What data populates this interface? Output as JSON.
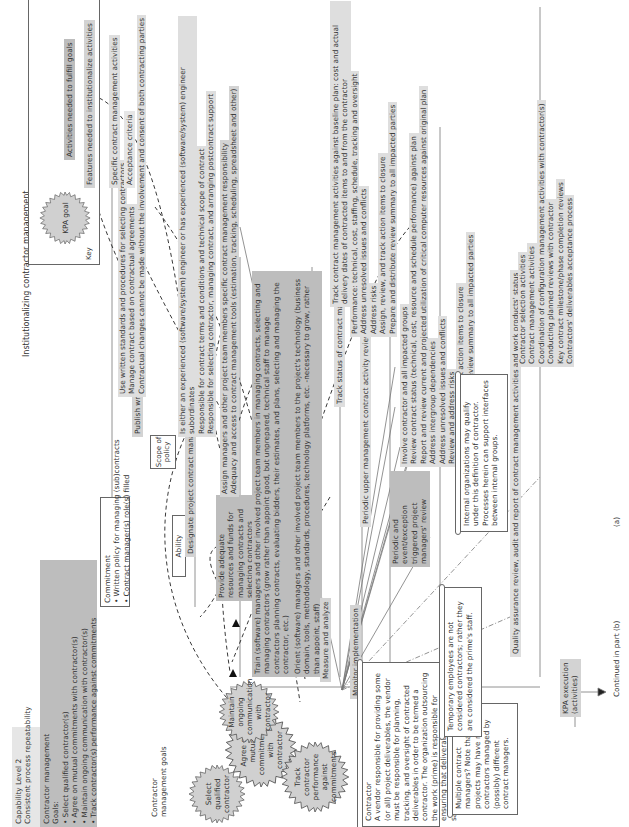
{
  "title": "Institutionalizing contractor management",
  "header": {
    "level": "Capability Level 2",
    "subtitle": "Consistent process repeatability",
    "kpa": "Contractor management",
    "goals_label": "Goals:",
    "goals": [
      "Select qualified contractor(s)",
      "Agree on mutual commitments with contractor(s)",
      "Maintain ongoing communication with contractor(s)",
      "Track contractor(s) performance against commitments"
    ]
  },
  "key": {
    "title": "Key",
    "seal_label": "KPA goal",
    "items": [
      "Activities needed to fulfill goals",
      "Features needed to institutionalize activities",
      "Specific contract management activities",
      "Acceptance criteria"
    ]
  },
  "commitment": {
    "title": "Commitment",
    "items": [
      "Written policy for managing (sub)contracts",
      "Contract manager(s) role(s) filled"
    ]
  },
  "policy": {
    "label": "Publish written contract management policy",
    "scope_note": "Scope of policy",
    "items": [
      "Use written standards and procedures for selecting contractors",
      "Manage contract based on contractual agreements",
      "Contractual changes cannot be made without the involvement and consent of both contracting parties"
    ]
  },
  "ability": {
    "label": "Ability",
    "designate": {
      "label": "Designate project contract manager(s)",
      "items": [
        "Is either an experienced (software/system) engineer or has experienced (software/system) engineer subordinates",
        "Responsible for contract terms and conditions and technical scope of contract",
        "Responsible for selecting contractor, managing contract, and arranging postcontract support"
      ]
    },
    "resources": {
      "label": "Provide adequate resources and funds for managing contracts and selecting contractors",
      "items": [
        "Assign managers and other project team members specific contract management responsibility",
        "Adequacy and access to contract management tools (estimation, tracking, scheduling, spreadsheet and other)"
      ]
    },
    "train": "Train (software) managers and other involved project team members in managing contracts, selecting and managing contractors (grow rather than appoint good, but unprepared, technical staff to manage contractors planning contracts, evaluating bidders, their estimates, and plans, selecting and managing the contractor, etc.)",
    "orient": "Orient (software) managers and other involved project team members to the project's technology (business domain, tools, methodology, standards, procedures, technology platforms, etc. -necessary to grow, rather than appoint, staff)"
  },
  "measure": {
    "label": "Measure and analyze",
    "track_status": "Track status of contract management activities",
    "track_items": [
      "Track contract management activities against baseline plan: cost and actual delivery dates of contracted items to and from the contractor"
    ]
  },
  "monitor": {
    "label": "Monitor implementation",
    "periodic_upper": "Periodic upper management contract activity review",
    "periodic_upper_items": [
      "Performance: technical, cost, staffing, schedule, tracking and oversight",
      "Address unresolved issues and conflicts",
      "Address risks",
      "Assign, review, and track action items to closure",
      "Prepare and distribute review summary to all impacted parties"
    ],
    "periodic_pm": "Periodic and event/exception triggered project managers' review",
    "periodic_pm_items": [
      "Involve contractor and all impacted groups",
      "Review contract status (technical, cost, resource and schedule performance) against plan",
      "Report and review current and projected utilization of critical computer resources against original plan",
      "Address intergroup dependencies",
      "Address unresolved issues and conflicts",
      "Review and address risks",
      "Assign, review, and track action items to closure",
      "Prepare and distribute review summary to all impacted parties"
    ],
    "qa": "Quality assurance review, audit and report of contract management activities and work products' status",
    "qa_items": [
      "Contractor selection activities",
      "Contract management activities",
      "Coordination of configuration management activities with contractor(s)",
      "Conducting planned reviews with contractor",
      "Key contract milestone/phase completion reviews",
      "Contractors' deliverables acceptance process"
    ]
  },
  "goals_label": "Contractor management goals",
  "seals": [
    "Select qualified contractor",
    "Agree on mutual commitments with contractor",
    "Maintain ongoing communication with contractor",
    "Track contractor performance against commitments"
  ],
  "notes": {
    "contractor_title": "Contractor",
    "contractor_body": "A vendor responsible for providing some (or all) project deliverables, the vendor must be responsible for planning, tracking, and oversight of contracted deliverables in order to be termed a contractor. The organization outsourcing the work (prime) is responsible for ensuring that deliverables accepted satisfy requisite criteria.",
    "multiple": "Multiple contract managers? Note that large projects may have multiple contractors managed by (possibly) different contract managers.",
    "temporary": "Temporary employees are not considered contractors; rather they are considered the prime's staff.",
    "internal": "Internal organizations may qualify under this definition of contractor. Processes herein can support interfaces between internal groups."
  },
  "kpa_execution": "KPA execution (activities)",
  "continued": "Continued in part (b)",
  "part_label": "(a)"
}
